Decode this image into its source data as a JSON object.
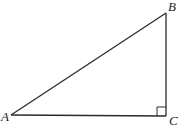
{
  "diagram": {
    "type": "right-triangle",
    "stroke_color": "#2b2b2b",
    "right_angle_at": "C",
    "vertices": [
      {
        "name": "A",
        "label": "A",
        "x": 11,
        "y": 115,
        "label_x": 1,
        "label_y": 121
      },
      {
        "name": "B",
        "label": "B",
        "x": 166,
        "y": 13,
        "label_x": 168,
        "label_y": 11
      },
      {
        "name": "C",
        "label": "C",
        "x": 166,
        "y": 116,
        "label_x": 169,
        "label_y": 125
      }
    ],
    "sides": [
      {
        "name": "AB",
        "from": "A",
        "to": "B"
      },
      {
        "name": "BC",
        "from": "B",
        "to": "C"
      },
      {
        "name": "AC",
        "from": "A",
        "to": "C"
      }
    ],
    "right_angle_marker_size": 9
  }
}
